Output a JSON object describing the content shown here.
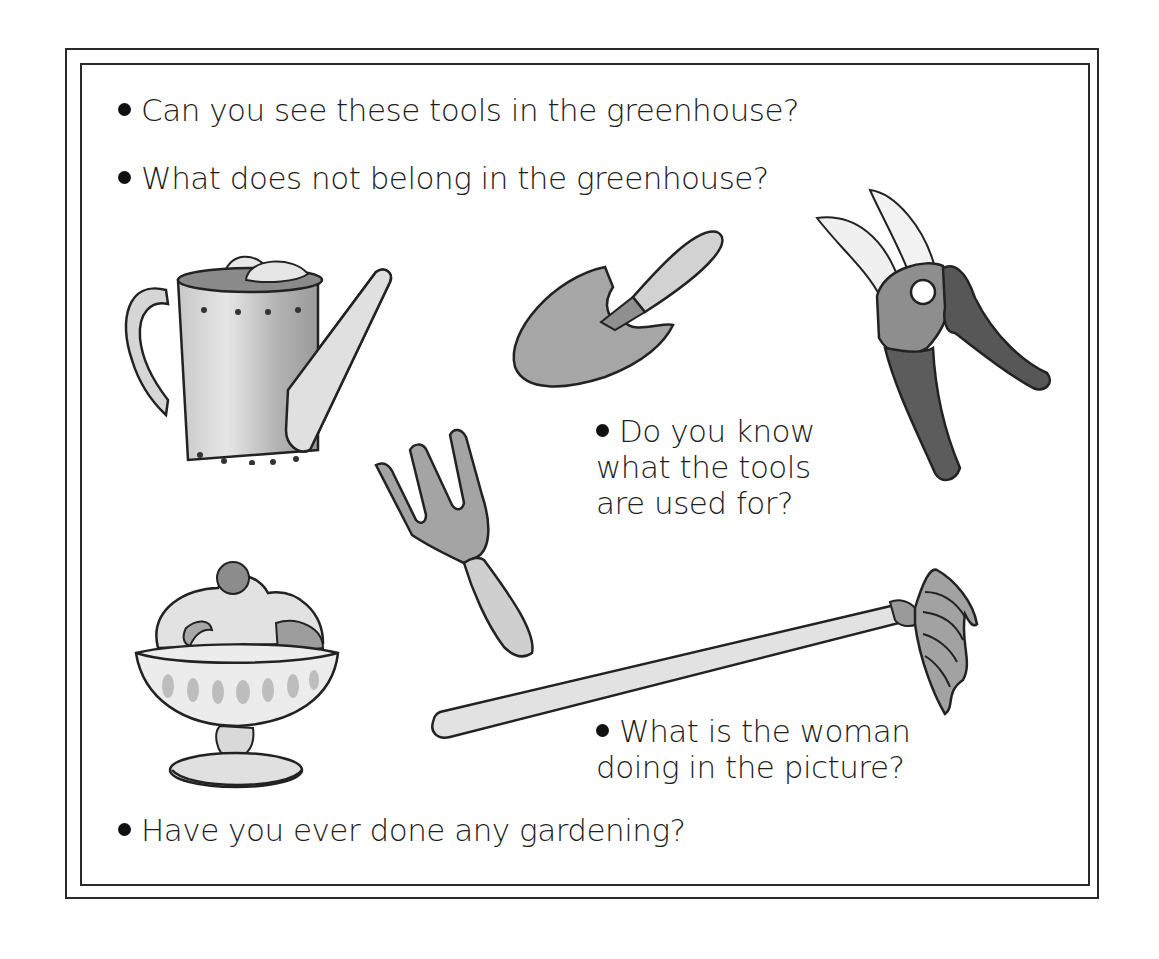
{
  "page": {
    "questions": [
      {
        "lines": [
          "Can you see these tools in the greenhouse?"
        ]
      },
      {
        "lines": [
          "What does not belong in the greenhouse?"
        ]
      },
      {
        "lines": [
          "Do you know",
          "what the tools",
          "are used for?"
        ]
      },
      {
        "lines": [
          "What is the woman",
          "doing in the picture?"
        ]
      },
      {
        "lines": [
          "Have you ever done any gardening?"
        ]
      }
    ],
    "illustrations": [
      {
        "name": "watering-can"
      },
      {
        "name": "trowel"
      },
      {
        "name": "pruning-shears"
      },
      {
        "name": "hand-fork"
      },
      {
        "name": "ice-cream-sundae"
      },
      {
        "name": "rake"
      }
    ]
  },
  "colors": {
    "ink": "#1e1e1e",
    "frame": "#2a2a2a",
    "metal_light": "#d4d4d4",
    "metal_mid": "#a8a8a8",
    "dark_handle": "#5a5a5a"
  }
}
